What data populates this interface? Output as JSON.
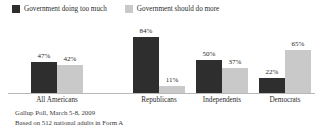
{
  "legend": {
    "items": [
      {
        "label": "Government doing too much",
        "color": "#2e2e2e",
        "icon": "legend-swatch-dark"
      },
      {
        "label": "Government should do more",
        "color": "#c9c9c9",
        "icon": "legend-swatch-light"
      }
    ]
  },
  "footnote": {
    "line1": "Gallup Poll, March 5-8, 2009",
    "line2": "Based on 512 national adults in Form A"
  },
  "chart_data": {
    "type": "bar",
    "title": "",
    "xlabel": "",
    "ylabel": "",
    "ylim": [
      0,
      100
    ],
    "grid": false,
    "legend_position": "top-left",
    "categories": [
      "All Americans",
      "Republicans",
      "Independents",
      "Democrats"
    ],
    "series": [
      {
        "name": "Government doing too much",
        "color": "#2e2e2e",
        "values": [
          47,
          84,
          50,
          22
        ],
        "labels": [
          "47%",
          "84%",
          "50%",
          "22%"
        ]
      },
      {
        "name": "Government should do more",
        "color": "#c9c9c9",
        "values": [
          42,
          11,
          37,
          65
        ],
        "labels": [
          "42%",
          "11%",
          "37%",
          "65%"
        ]
      }
    ]
  }
}
